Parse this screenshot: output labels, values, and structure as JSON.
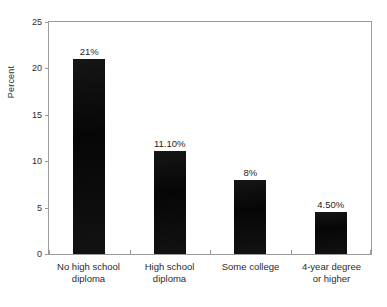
{
  "chart_data": {
    "type": "bar",
    "title": "",
    "subtitle": "",
    "xlabel": "",
    "ylabel": "Percent",
    "categories": [
      "No high school diploma",
      "High school diploma",
      "Some college",
      "4-year degree or higher"
    ],
    "category_lines": [
      [
        "No high school",
        "diploma"
      ],
      [
        "High school",
        "diploma"
      ],
      [
        "Some college",
        ""
      ],
      [
        "4-year degree",
        "or higher"
      ]
    ],
    "values": [
      21,
      11.1,
      8,
      4.5
    ],
    "data_labels": [
      "21%",
      "11.10%",
      "8%",
      "4.50%"
    ],
    "ylim": [
      0,
      25
    ],
    "yticks": [
      0,
      5,
      10,
      15,
      20,
      25
    ],
    "ytick_labels": [
      "0",
      "5",
      "10",
      "15",
      "20",
      "25"
    ],
    "grid": false,
    "legend": null,
    "bar_color": "#0d0d0d",
    "axis_color": "#9a9a9a",
    "background": "#ffffff"
  }
}
